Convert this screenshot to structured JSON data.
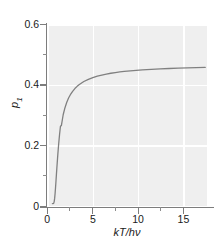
{
  "chart_data": {
    "type": "line",
    "title": "",
    "subtitle": "",
    "xlabel": "kT/hν",
    "ylabel": "p",
    "ylabel_sub": "1",
    "xlim": [
      -0.6,
      17.2
    ],
    "ylim": [
      -0.012,
      0.62
    ],
    "xticks": [
      0,
      5,
      10,
      15
    ],
    "xtick_labels": [
      "0",
      "5",
      "10",
      "15"
    ],
    "xticks_minor": [
      2.5,
      7.5,
      12.5
    ],
    "yticks": [
      0,
      0.2,
      0.4,
      0.6
    ],
    "ytick_labels": [
      "0",
      "0.2",
      "0.4",
      "0.6"
    ],
    "yticks_minor": [
      0.1,
      0.3,
      0.5
    ],
    "grid": true,
    "grid_color": "#ffffff",
    "panel_color": "#efefef",
    "axis_color": "#7d7d7d",
    "legend": null,
    "series": [
      {
        "name": "p1",
        "color": "#808080",
        "linewidth": 1.3,
        "x": [
          0.0,
          0.05,
          0.1,
          0.15,
          0.2,
          0.25,
          0.3,
          0.35,
          0.4,
          0.45,
          0.5,
          0.6,
          0.7,
          0.8,
          0.9,
          1.0,
          1.2,
          1.4,
          1.6,
          1.8,
          2.0,
          2.25,
          2.5,
          2.75,
          3.0,
          3.5,
          4.0,
          4.5,
          5.0,
          5.5,
          6.0,
          6.5,
          7.0,
          7.5,
          8.0,
          9.0,
          10.0,
          11.0,
          12.0,
          13.0,
          14.0,
          15.0,
          16.0,
          17.0
        ],
        "y": [
          0.0,
          0.0,
          0.0,
          0.0013,
          0.0066,
          0.0177,
          0.0344,
          0.0551,
          0.078,
          0.1014,
          0.1245,
          0.168,
          0.2063,
          0.2393,
          0.2676,
          0.2689,
          0.3066,
          0.331,
          0.3496,
          0.3642,
          0.3759,
          0.3876,
          0.397,
          0.4047,
          0.4112,
          0.4214,
          0.429,
          0.435,
          0.4398,
          0.4438,
          0.4471,
          0.4499,
          0.4523,
          0.4544,
          0.4562,
          0.4592,
          0.4616,
          0.4635,
          0.4651,
          0.4664,
          0.4676,
          0.4685,
          0.4694,
          0.4701
        ]
      }
    ],
    "asymptote": 0.47
  }
}
